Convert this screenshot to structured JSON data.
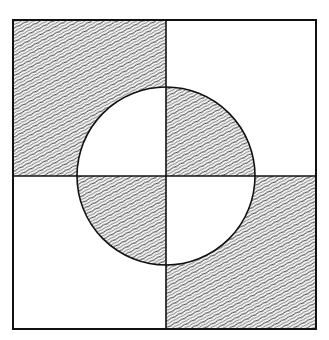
{
  "figure": {
    "colors": {
      "background": "#ffffff",
      "line": "#111111",
      "hatch": "#555555"
    },
    "square": {
      "x": 13,
      "y": 20,
      "width": 303,
      "height": 309
    },
    "center": {
      "x": 166,
      "y": 176
    },
    "circle_radius": 89
  }
}
